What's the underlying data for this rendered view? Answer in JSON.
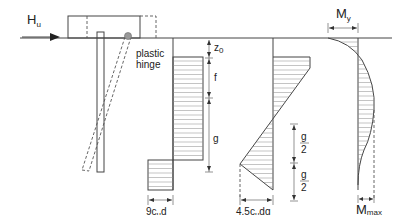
{
  "figure": {
    "type": "pile-failure-mechanism-diagram",
    "panels": [
      {
        "id": "pile",
        "description": "Restrained pile head under lateral load with plastic hinge"
      },
      {
        "id": "soil-reaction",
        "description": "Soil reaction distribution"
      },
      {
        "id": "shear",
        "description": "Shear force distribution"
      },
      {
        "id": "moment",
        "description": "Bending moment distribution"
      }
    ]
  },
  "labels": {
    "load": {
      "main": "H",
      "sub": "u"
    },
    "hinge_line1": "plastic",
    "hinge_line2": "hinge",
    "z0": {
      "main": "z",
      "sub": "0"
    },
    "f": "f",
    "g": "g",
    "soil_width": {
      "pre": "9c",
      "sub": "u",
      "post": "d"
    },
    "shear_width": {
      "pre": "4.5c",
      "sub": "u",
      "post": "dg"
    },
    "g_half_num": "g",
    "g_half_den": "2",
    "my": {
      "main": "M",
      "sub": "y"
    },
    "mmax": {
      "main": "M",
      "sub": "max"
    }
  },
  "colors": {
    "line": "#444444",
    "hatch": "#888888",
    "hinge": "#999999"
  }
}
